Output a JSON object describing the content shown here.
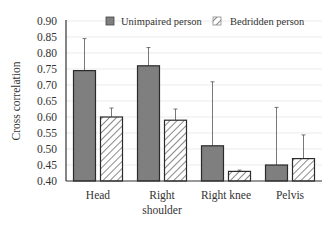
{
  "chart_data": {
    "type": "bar",
    "title": "",
    "xlabel": "",
    "ylabel": "Cross correlation",
    "ylim": [
      0.4,
      0.9
    ],
    "yticks": [
      "0.40",
      "0.45",
      "0.50",
      "0.55",
      "0.60",
      "0.65",
      "0.70",
      "0.75",
      "0.80",
      "0.85",
      "0.90"
    ],
    "grid": true,
    "legend_position": "top",
    "categories": [
      [
        "Head"
      ],
      [
        "Right",
        "shoulder"
      ],
      [
        "Right knee"
      ],
      [
        "Pelvis"
      ]
    ],
    "series": [
      {
        "name": "Unimpaired person",
        "style": "solid",
        "color": "#7f7f7f",
        "values": [
          0.745,
          0.76,
          0.51,
          0.45
        ],
        "error_upper": [
          0.845,
          0.817,
          0.71,
          0.63
        ]
      },
      {
        "name": "Bedridden person",
        "style": "hatched",
        "color": "#ffffff",
        "hatch_color": "#8a8a8a",
        "values": [
          0.6,
          0.59,
          0.43,
          0.47
        ],
        "error_upper": [
          0.628,
          0.625,
          0.434,
          0.544
        ]
      }
    ]
  }
}
